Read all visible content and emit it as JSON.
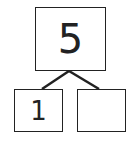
{
  "number_bond": {
    "whole": "5",
    "parts": [
      "1",
      ""
    ]
  },
  "colors": {
    "stroke": "#222222",
    "background": "#ffffff"
  }
}
